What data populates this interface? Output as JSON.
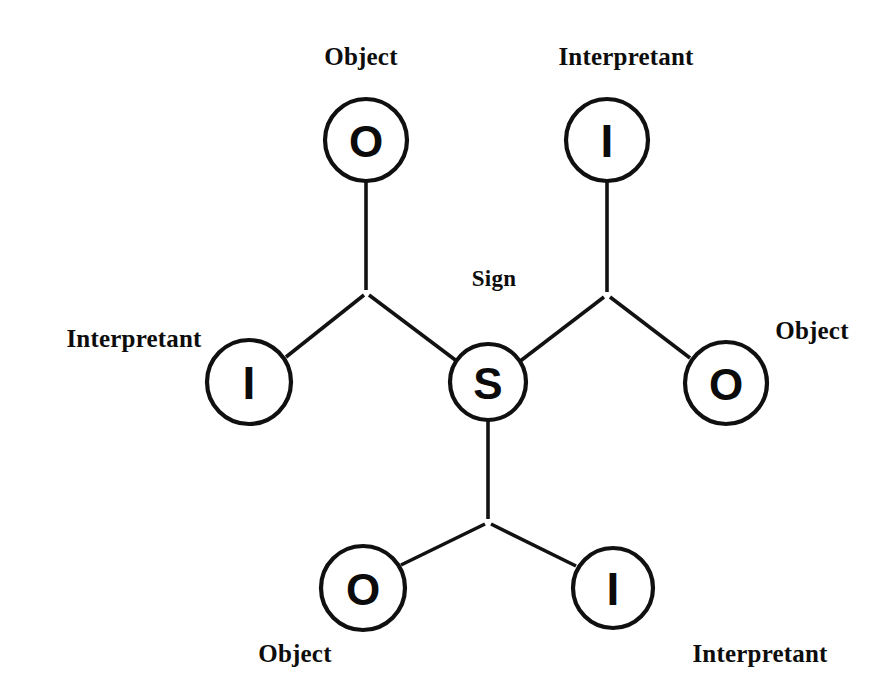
{
  "diagram": {
    "background_color": "#ffffff",
    "stroke_color": "#121212",
    "nodes": {
      "center_sign": {
        "letter": "S",
        "meaning": "Sign",
        "cx": 488,
        "cy": 382,
        "r": 38
      },
      "top_left_object": {
        "letter": "O",
        "meaning": "Object",
        "cx": 366,
        "cy": 140,
        "r": 41
      },
      "top_right_interpretant": {
        "letter": "I",
        "meaning": "Interpretant",
        "cx": 607,
        "cy": 140,
        "r": 41
      },
      "left_interpretant": {
        "letter": "I",
        "meaning": "Interpretant",
        "cx": 249,
        "cy": 382,
        "r": 42
      },
      "right_object": {
        "letter": "O",
        "meaning": "Object",
        "cx": 726,
        "cy": 383,
        "r": 41
      },
      "bottom_left_object": {
        "letter": "O",
        "meaning": "Object",
        "cx": 363,
        "cy": 588,
        "r": 42
      },
      "bottom_right_interpretant": {
        "letter": "I",
        "meaning": "Interpretant",
        "cx": 613,
        "cy": 588,
        "r": 40
      }
    },
    "junctions": {
      "upper_left_vertex": {
        "x": 366,
        "y": 293
      },
      "upper_right_vertex": {
        "x": 607,
        "y": 295
      },
      "lower_vertex": {
        "x": 488,
        "y": 522
      }
    },
    "labels": {
      "top_left": "Object",
      "top_right": "Interpretant",
      "sign": "Sign",
      "left": "Interpretant",
      "right": "Object",
      "bottom_left": "Object",
      "bottom_right": "Interpretant"
    },
    "edges": [
      {
        "name": "object-to-upper-left-vertex",
        "from": "top_left_object",
        "to": "upper_left_vertex"
      },
      {
        "name": "upper-left-vertex-to-left-interpretant",
        "from": "upper_left_vertex",
        "to": "left_interpretant"
      },
      {
        "name": "upper-left-vertex-to-sign",
        "from": "upper_left_vertex",
        "to": "center_sign"
      },
      {
        "name": "interpretant-to-upper-right-vertex",
        "from": "top_right_interpretant",
        "to": "upper_right_vertex"
      },
      {
        "name": "upper-right-vertex-to-sign",
        "from": "upper_right_vertex",
        "to": "center_sign"
      },
      {
        "name": "upper-right-vertex-to-right-object",
        "from": "upper_right_vertex",
        "to": "right_object"
      },
      {
        "name": "sign-to-lower-vertex",
        "from": "center_sign",
        "to": "lower_vertex"
      },
      {
        "name": "lower-vertex-to-bottom-left-object",
        "from": "lower_vertex",
        "to": "bottom_left_object"
      },
      {
        "name": "lower-vertex-to-bottom-right-interpretant",
        "from": "lower_vertex",
        "to": "bottom_right_interpretant"
      }
    ]
  }
}
